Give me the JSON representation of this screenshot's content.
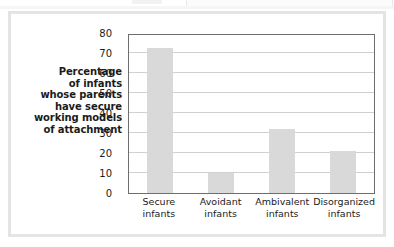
{
  "figure": {
    "axis_title_lines": [
      "Percentage",
      "of infants",
      "whose parents",
      "have secure",
      "working models",
      "of attachment"
    ],
    "bar_color": "#d9d9d9",
    "grid_color": "#d0d0d0",
    "frame_color": "#6e6e6e",
    "panel_border_color": "#e4e4e4"
  },
  "chart_data": {
    "type": "bar",
    "title": "",
    "xlabel": "",
    "ylabel": "Percentage of infants whose parents have secure working models of attachment",
    "categories": [
      "Secure infants",
      "Avoidant infants",
      "Ambivalent infants",
      "Disorganized infants"
    ],
    "category_lines": [
      [
        "Secure",
        "infants"
      ],
      [
        "Avoidant",
        "infants"
      ],
      [
        "Ambivalent",
        "infants"
      ],
      [
        "Disorganized",
        "infants"
      ]
    ],
    "values": [
      72.5,
      10,
      32,
      21
    ],
    "ylim": [
      0,
      80
    ],
    "yticks": [
      0,
      10,
      20,
      30,
      40,
      50,
      60,
      70,
      80
    ],
    "ytick_labels": [
      "0",
      "10",
      "20",
      "30",
      "40",
      "50",
      "60",
      "70",
      "80"
    ],
    "grid": true,
    "legend": false
  }
}
